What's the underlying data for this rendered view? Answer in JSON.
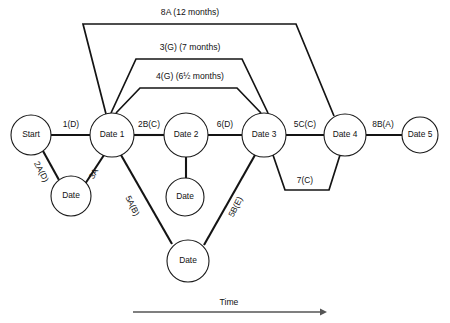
{
  "diagram": {
    "background_color": "#ffffff",
    "line_color": "#141414",
    "axis_color": "#555555",
    "nodes": [
      {
        "id": "start",
        "label": "Start",
        "cx": 31,
        "cy": 135,
        "r": 20
      },
      {
        "id": "date1",
        "label": "Date 1",
        "cx": 112,
        "cy": 135,
        "r": 22
      },
      {
        "id": "date2",
        "label": "Date 2",
        "cx": 186,
        "cy": 135,
        "r": 22
      },
      {
        "id": "date3",
        "label": "Date 3",
        "cx": 264,
        "cy": 135,
        "r": 22
      },
      {
        "id": "date4",
        "label": "Date 4",
        "cx": 345,
        "cy": 135,
        "r": 21
      },
      {
        "id": "date5",
        "label": "Date 5",
        "cx": 420,
        "cy": 135,
        "r": 18
      },
      {
        "id": "dateA",
        "label": "Date",
        "cx": 71,
        "cy": 196,
        "r": 20
      },
      {
        "id": "dateB",
        "label": "Date",
        "cx": 185,
        "cy": 197,
        "r": 19
      },
      {
        "id": "dateC",
        "label": "Date",
        "cx": 188,
        "cy": 261,
        "r": 21
      }
    ],
    "edge_labels": {
      "e_1d": {
        "text": "1(D)",
        "x": 71,
        "y": 127,
        "rotate": 0
      },
      "e_2ad": {
        "text": "2A(D)",
        "x": 39,
        "y": 173,
        "rotate": 62
      },
      "e_3a": {
        "text": "3A",
        "x": 96,
        "y": 175,
        "rotate": -61
      },
      "e_2bc": {
        "text": "2B(C)",
        "x": 149,
        "y": 127,
        "rotate": 0
      },
      "e_6d": {
        "text": "6(D)",
        "x": 225,
        "y": 127,
        "rotate": 0
      },
      "e_5cc": {
        "text": "5C(C)",
        "x": 305,
        "y": 127,
        "rotate": 0
      },
      "e_8ba": {
        "text": "8B(A)",
        "x": 383,
        "y": 127,
        "rotate": 0
      },
      "e_5ab": {
        "text": "5A(B)",
        "x": 130,
        "y": 207,
        "rotate": 63
      },
      "e_5be": {
        "text": "5B(E)",
        "x": 238,
        "y": 208,
        "rotate": -63
      },
      "e_7c": {
        "text": "7(C)",
        "x": 305,
        "y": 183,
        "rotate": 0
      }
    },
    "brackets": [
      {
        "id": "b_8a",
        "text": "8A (12 months)",
        "label_x": 190,
        "label_y": 15
      },
      {
        "id": "b_3g",
        "text": "3(G) (7 months)",
        "label_x": 190,
        "label_y": 50
      },
      {
        "id": "b_4g",
        "text": "4(G) (6½ months)",
        "label_x": 190,
        "label_y": 79
      }
    ],
    "axis": {
      "label": "Time",
      "label_x": 229,
      "label_y": 305,
      "x1": 133,
      "x2": 325,
      "y": 312
    }
  }
}
